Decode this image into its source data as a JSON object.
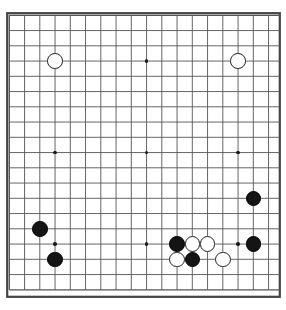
{
  "board": {
    "name": "go-board",
    "size": 19,
    "label": "Go board 19x19",
    "line_color": "#555555",
    "border_color": "#444444",
    "background_color": "#ffffff",
    "black_stone_color": "#141414",
    "white_stone_color": "#ffffff",
    "star_point_color": "#1a1a1a",
    "geometry": {
      "origin_x": 9.3,
      "origin_y": 15.3,
      "spacing": 15.25,
      "stone_diameter": 15.6,
      "star_point_diameter": 3.4,
      "border_left": 6,
      "border_top": 12,
      "border_width": 275,
      "border_height": 286
    },
    "star_points": [
      {
        "col": 3,
        "row": 3
      },
      {
        "col": 9,
        "row": 3
      },
      {
        "col": 15,
        "row": 3
      },
      {
        "col": 3,
        "row": 9
      },
      {
        "col": 9,
        "row": 9
      },
      {
        "col": 15,
        "row": 9
      },
      {
        "col": 3,
        "row": 15
      },
      {
        "col": 9,
        "row": 15
      },
      {
        "col": 15,
        "row": 15
      }
    ],
    "stones": [
      {
        "color": "white",
        "col": 3,
        "row": 3,
        "label": "white-stone-d16"
      },
      {
        "color": "white",
        "col": 15,
        "row": 3,
        "label": "white-stone-q16"
      },
      {
        "color": "black",
        "col": 16,
        "row": 12,
        "label": "black-stone-r7"
      },
      {
        "color": "black",
        "col": 2,
        "row": 14,
        "label": "black-stone-c5"
      },
      {
        "color": "black",
        "col": 11,
        "row": 15,
        "label": "black-stone-m4"
      },
      {
        "color": "white",
        "col": 12,
        "row": 15,
        "label": "white-stone-n4"
      },
      {
        "color": "white",
        "col": 13,
        "row": 15,
        "label": "white-stone-o4"
      },
      {
        "color": "black",
        "col": 16,
        "row": 15,
        "label": "black-stone-r4"
      },
      {
        "color": "white",
        "col": 11,
        "row": 16,
        "label": "white-stone-m3"
      },
      {
        "color": "black",
        "col": 12,
        "row": 16,
        "label": "black-stone-n3"
      },
      {
        "color": "white",
        "col": 14,
        "row": 16,
        "label": "white-stone-p3"
      },
      {
        "color": "black",
        "col": 3,
        "row": 16,
        "label": "black-stone-d3"
      }
    ],
    "counts": {
      "black_stones": 6,
      "white_stones": 6,
      "total_stones": 12
    }
  }
}
